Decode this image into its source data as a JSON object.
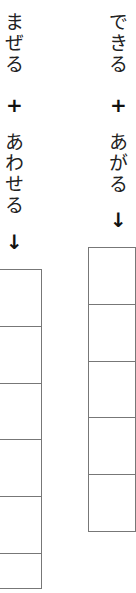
{
  "left_column": {
    "word1": "まぜる",
    "plus": "+",
    "word2": "あわせる",
    "arrow": "↓",
    "answer_boxes": 6
  },
  "right_column": {
    "word1": "できる",
    "plus": "+",
    "word2": "あがる",
    "arrow": "↓",
    "answer_boxes": 5
  },
  "colors": {
    "text": "#222222",
    "grid_line": "#777777",
    "background": "#ffffff"
  }
}
